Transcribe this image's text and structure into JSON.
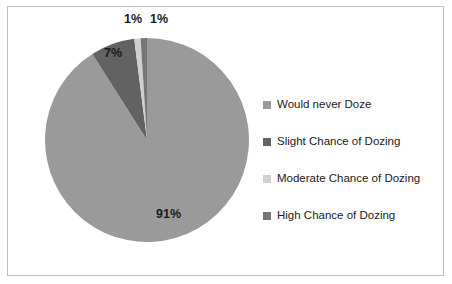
{
  "chart_data": {
    "type": "pie",
    "title": "",
    "subtitle": "",
    "xlabel": "",
    "ylabel": "",
    "grid": false,
    "legend_position": "right",
    "units": "percent",
    "start_angle_deg": 0,
    "direction": "clockwise",
    "categories": [
      "Would never Doze",
      "Slight Chance of Dozing",
      "Moderate Chance of Dozing",
      "High Chance of Dozing"
    ],
    "values": [
      91,
      7,
      1,
      1
    ],
    "data_labels": [
      "91%",
      "7%",
      "1%",
      "1%"
    ],
    "colors": [
      "#9a9a9a",
      "#626262",
      "#cfcfcf",
      "#757575"
    ],
    "slices": [
      {
        "label": "Would never Doze",
        "value": 91,
        "data_label": "91%",
        "color": "#9a9a9a"
      },
      {
        "label": "Slight Chance of Dozing",
        "value": 7,
        "data_label": "7%",
        "color": "#626262"
      },
      {
        "label": "Moderate Chance of Dozing",
        "value": 1,
        "data_label": "1%",
        "color": "#cfcfcf"
      },
      {
        "label": "High Chance of Dozing",
        "value": 1,
        "data_label": "1%",
        "color": "#757575"
      }
    ]
  },
  "legend": {
    "items": [
      {
        "label": "Would never Doze",
        "color": "#9a9a9a"
      },
      {
        "label": "Slight Chance of Dozing",
        "color": "#626262"
      },
      {
        "label": "Moderate Chance of Dozing",
        "color": "#cfcfcf"
      },
      {
        "label": "High Chance of Dozing",
        "color": "#757575"
      }
    ]
  },
  "style": {
    "background": "#ffffff",
    "border_color": "#bfbfbf",
    "label_color": "#1a1a1a"
  }
}
